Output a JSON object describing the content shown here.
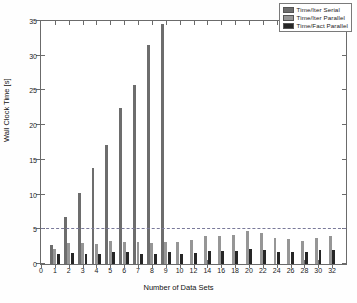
{
  "chart_data": {
    "type": "bar",
    "title": "",
    "xlabel": "Number of Data Sets",
    "ylabel": "Wall Clock Time [s]",
    "categories": [
      "1",
      "2",
      "3",
      "4",
      "5",
      "6",
      "7",
      "8",
      "9",
      "10",
      "12",
      "14",
      "16",
      "18",
      "20",
      "22",
      "24",
      "26",
      "28",
      "30",
      "32"
    ],
    "xtick_labels": [
      "0",
      "1",
      "2",
      "3",
      "4",
      "5",
      "6",
      "7",
      "8",
      "9",
      "10",
      "12",
      "14",
      "16",
      "18",
      "20",
      "22",
      "24",
      "26",
      "28",
      "30",
      "32"
    ],
    "ytick_labels": [
      "0",
      "5",
      "10",
      "15",
      "20",
      "25",
      "30",
      "35"
    ],
    "ylim": [
      0,
      35
    ],
    "ytick_step": 5,
    "grid": false,
    "legend_position": "top-right",
    "series": [
      {
        "name": "Time/Iter   Serial",
        "color": "#6d6d6d",
        "values": [
          2.8,
          6.7,
          10.2,
          13.8,
          17.2,
          22.4,
          25.8,
          31.6,
          34.5,
          null,
          null,
          null,
          null,
          null,
          null,
          null,
          null,
          null,
          null,
          null,
          null
        ]
      },
      {
        "name": "Time/Iter   Parallel",
        "color": "#969696",
        "values": [
          2.2,
          3.0,
          3.0,
          2.9,
          3.3,
          3.1,
          3.2,
          3.0,
          3.1,
          3.1,
          3.5,
          4.0,
          4.0,
          4.2,
          4.7,
          4.4,
          3.7,
          3.6,
          3.3,
          3.8,
          4.0
        ]
      },
      {
        "name": "Time/Fact Parallel",
        "color": "#262626",
        "values": [
          1.4,
          1.6,
          1.5,
          1.5,
          1.7,
          1.7,
          1.4,
          1.4,
          1.7,
          1.5,
          1.6,
          1.9,
          1.9,
          1.9,
          2.2,
          2.0,
          1.7,
          1.7,
          1.8,
          2.0,
          2.0
        ]
      }
    ],
    "threshold_line": {
      "value": 5,
      "style": "dashed",
      "color": "#7a7a9a"
    }
  }
}
